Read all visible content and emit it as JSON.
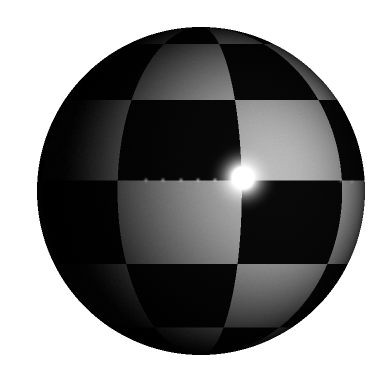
{
  "scene": {
    "title": "Raytraced Sphere with Checkerboard Texture",
    "canvas_width": 390,
    "canvas_height": 385,
    "background_color": "#ffffff",
    "render_style": "raytraced-phong",
    "noise_amount": 9
  },
  "sphere": {
    "name": "textured-sphere",
    "center_x": 201,
    "center_y": 191,
    "radius": 164,
    "edge_softness": 1.2
  },
  "texture": {
    "type": "checkerboard",
    "mapping": "spherical-uv",
    "columns": 8,
    "rows": 6,
    "u_offset": 0.46,
    "v_offset": 0.02,
    "color_light": "#6e6e6e",
    "color_dark": "#060606",
    "light_reflectance": 0.72,
    "dark_reflectance": 0.035
  },
  "lighting": {
    "ambient": 0.016,
    "diffuse_intensity": 1.0,
    "light_dir_x": 0.52,
    "light_dir_y": -0.12,
    "light_dir_z": 0.84,
    "falloff_power": 1.55,
    "gamma": 1.0
  },
  "specular": {
    "name": "primary-specular-highlight",
    "center_x": 243,
    "center_y": 178,
    "core_radius": 11,
    "glow_radius": 38,
    "color": "#ffffff",
    "intensity": 1.0,
    "shininess": 96
  },
  "sparkles": {
    "label": "secondary-specular-dots",
    "radius": 1.6,
    "color": "#cfcfcf",
    "points": [
      {
        "x": 146,
        "y": 180,
        "brightness": 0.52
      },
      {
        "x": 163,
        "y": 180,
        "brightness": 0.58
      },
      {
        "x": 181,
        "y": 180,
        "brightness": 0.62
      },
      {
        "x": 198,
        "y": 180,
        "brightness": 0.66
      },
      {
        "x": 215,
        "y": 180,
        "brightness": 0.7
      },
      {
        "x": 341,
        "y": 181,
        "brightness": 0.4
      },
      {
        "x": 352,
        "y": 182,
        "brightness": 0.34
      }
    ]
  }
}
